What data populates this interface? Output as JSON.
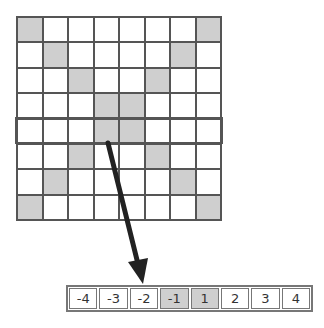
{
  "grid": {
    "rows": 8,
    "cols": 8,
    "shaded_cells": [
      [
        0,
        0
      ],
      [
        0,
        7
      ],
      [
        1,
        1
      ],
      [
        1,
        6
      ],
      [
        2,
        2
      ],
      [
        2,
        5
      ],
      [
        3,
        3
      ],
      [
        3,
        4
      ],
      [
        4,
        3
      ],
      [
        4,
        4
      ],
      [
        5,
        2
      ],
      [
        5,
        5
      ],
      [
        6,
        1
      ],
      [
        6,
        6
      ],
      [
        7,
        0
      ],
      [
        7,
        7
      ]
    ],
    "highlighted_row": 4,
    "shade_color": "#cfcfcf",
    "line_color": "#555555"
  },
  "arrow": {
    "from": [
      108,
      143
    ],
    "to": [
      143,
      284
    ],
    "color": "#222222"
  },
  "strip": {
    "cells": [
      {
        "label": "-4",
        "shaded": false
      },
      {
        "label": "-3",
        "shaded": false
      },
      {
        "label": "-2",
        "shaded": false
      },
      {
        "label": "-1",
        "shaded": true
      },
      {
        "label": "1",
        "shaded": true
      },
      {
        "label": "2",
        "shaded": false
      },
      {
        "label": "3",
        "shaded": false
      },
      {
        "label": "4",
        "shaded": false
      }
    ]
  }
}
